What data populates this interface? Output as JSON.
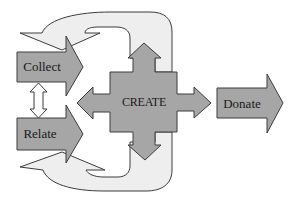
{
  "diagram": {
    "nodes": [
      {
        "id": "collect",
        "label": "Collect"
      },
      {
        "id": "relate",
        "label": "Relate"
      },
      {
        "id": "create",
        "label": "CREATE"
      },
      {
        "id": "donate",
        "label": "Donate"
      }
    ],
    "edges": [
      {
        "from": "collect",
        "to": "relate",
        "type": "bidirectional"
      },
      {
        "from": "collect",
        "to": "create"
      },
      {
        "from": "relate",
        "to": "create"
      },
      {
        "from": "create",
        "to": "collect",
        "type": "loop-top"
      },
      {
        "from": "create",
        "to": "relate",
        "type": "loop-bottom"
      },
      {
        "from": "create",
        "to": "donate"
      }
    ]
  },
  "colors": {
    "arrow_fill": "#a6a6a6",
    "loop_fill": "#eeeeee",
    "outline": "#3c3c3c"
  }
}
